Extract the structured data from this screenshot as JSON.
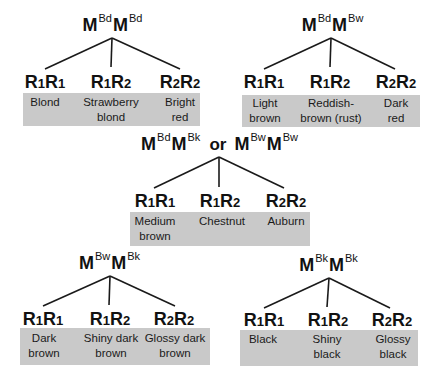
{
  "colors": {
    "box_fill": "#c9c9c9",
    "line": "#1a1a1a"
  },
  "trees": [
    {
      "parent": {
        "a": "M",
        "a_sup": "Bd",
        "b": "M",
        "b_sup": "Bd"
      },
      "genotypes": [
        {
          "g1": "R",
          "s1": "1",
          "g2": "R",
          "s2": "1",
          "phenotype_line1": "Blond",
          "phenotype_line2": ""
        },
        {
          "g1": "R",
          "s1": "1",
          "g2": "R",
          "s2": "2",
          "phenotype_line1": "Strawberry",
          "phenotype_line2": "blond"
        },
        {
          "g1": "R",
          "s1": "2",
          "g2": "R",
          "s2": "2",
          "phenotype_line1": "Bright",
          "phenotype_line2": "red"
        }
      ]
    },
    {
      "parent": {
        "a": "M",
        "a_sup": "Bd",
        "b": "M",
        "b_sup": "Bw"
      },
      "genotypes": [
        {
          "g1": "R",
          "s1": "1",
          "g2": "R",
          "s2": "1",
          "phenotype_line1": "Light",
          "phenotype_line2": "brown"
        },
        {
          "g1": "R",
          "s1": "1",
          "g2": "R",
          "s2": "2",
          "phenotype_line1": "Reddish-",
          "phenotype_line2": "brown (rust)"
        },
        {
          "g1": "R",
          "s1": "2",
          "g2": "R",
          "s2": "2",
          "phenotype_line1": "Dark",
          "phenotype_line2": "red"
        }
      ]
    },
    {
      "parent": {
        "a": "M",
        "a_sup": "Bd",
        "b": "M",
        "b_sup": "Bk",
        "or": "or",
        "c": "M",
        "c_sup": "Bw",
        "d": "M",
        "d_sup": "Bw"
      },
      "genotypes": [
        {
          "g1": "R",
          "s1": "1",
          "g2": "R",
          "s2": "1",
          "phenotype_line1": "Medium",
          "phenotype_line2": "brown"
        },
        {
          "g1": "R",
          "s1": "1",
          "g2": "R",
          "s2": "2",
          "phenotype_line1": "Chestnut",
          "phenotype_line2": ""
        },
        {
          "g1": "R",
          "s1": "2",
          "g2": "R",
          "s2": "2",
          "phenotype_line1": "Auburn",
          "phenotype_line2": ""
        }
      ]
    },
    {
      "parent": {
        "a": "M",
        "a_sup": "Bw",
        "b": "M",
        "b_sup": "Bk"
      },
      "genotypes": [
        {
          "g1": "R",
          "s1": "1",
          "g2": "R",
          "s2": "1",
          "phenotype_line1": "Dark",
          "phenotype_line2": "brown"
        },
        {
          "g1": "R",
          "s1": "1",
          "g2": "R",
          "s2": "2",
          "phenotype_line1": "Shiny dark",
          "phenotype_line2": "brown"
        },
        {
          "g1": "R",
          "s1": "2",
          "g2": "R",
          "s2": "2",
          "phenotype_line1": "Glossy dark",
          "phenotype_line2": "brown"
        }
      ]
    },
    {
      "parent": {
        "a": "M",
        "a_sup": "Bk",
        "b": "M",
        "b_sup": "Bk"
      },
      "genotypes": [
        {
          "g1": "R",
          "s1": "1",
          "g2": "R",
          "s2": "1",
          "phenotype_line1": "Black",
          "phenotype_line2": ""
        },
        {
          "g1": "R",
          "s1": "1",
          "g2": "R",
          "s2": "2",
          "phenotype_line1": "Shiny",
          "phenotype_line2": "black"
        },
        {
          "g1": "R",
          "s1": "2",
          "g2": "R",
          "s2": "2",
          "phenotype_line1": "Glossy",
          "phenotype_line2": "black"
        }
      ]
    }
  ]
}
